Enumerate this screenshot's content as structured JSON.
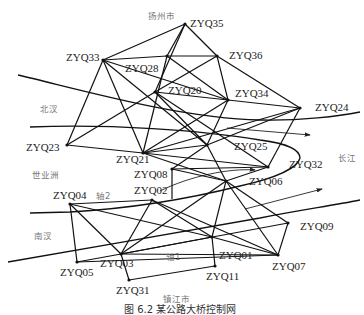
{
  "figure": {
    "caption": "图 6.2   某公路大桥控制网"
  },
  "regions": [
    {
      "id": "yangzhou",
      "label": "扬州市",
      "x": 148,
      "y": 19
    },
    {
      "id": "beihan",
      "label": "北汊",
      "x": 40,
      "y": 112
    },
    {
      "id": "shiyezhou",
      "label": "世业洲",
      "x": 32,
      "y": 178
    },
    {
      "id": "nanhan",
      "label": "南汊",
      "x": 34,
      "y": 239
    },
    {
      "id": "changjiang",
      "label": "长江",
      "x": 338,
      "y": 161
    },
    {
      "id": "zhenjiang",
      "label": "镇江市",
      "x": 163,
      "y": 302
    },
    {
      "id": "axis1",
      "label": "轴1",
      "x": 166,
      "y": 260
    },
    {
      "id": "axis2",
      "label": "轴2",
      "x": 96,
      "y": 199
    }
  ],
  "stations": [
    {
      "id": "ZYQ35",
      "label": "ZYQ35",
      "x": 185,
      "y": 24,
      "lx": 190,
      "ly": 27
    },
    {
      "id": "ZYQ33",
      "label": "ZYQ33",
      "x": 103,
      "y": 60,
      "lx": 66,
      "ly": 61
    },
    {
      "id": "ZYQ28",
      "label": "ZYQ28",
      "x": 167,
      "y": 56,
      "lx": 125,
      "ly": 72
    },
    {
      "id": "ZYQ36",
      "label": "ZYQ36",
      "x": 217,
      "y": 56,
      "lx": 229,
      "ly": 59
    },
    {
      "id": "ZYQ20",
      "label": "ZYQ20",
      "x": 155,
      "y": 92,
      "lx": 168,
      "ly": 94
    },
    {
      "id": "ZYQ34",
      "label": "ZYQ34",
      "x": 228,
      "y": 100,
      "lx": 235,
      "ly": 97
    },
    {
      "id": "ZYQ24",
      "label": "ZYQ24",
      "x": 300,
      "y": 108,
      "lx": 315,
      "ly": 111
    },
    {
      "id": "ZYQ23",
      "label": "ZYQ23",
      "x": 67,
      "y": 145,
      "lx": 26,
      "ly": 151
    },
    {
      "id": "ZYQ21",
      "label": "ZYQ21",
      "x": 143,
      "y": 153,
      "lx": 116,
      "ly": 163
    },
    {
      "id": "ZYQ25",
      "label": "ZYQ25",
      "x": 207,
      "y": 145,
      "lx": 234,
      "ly": 150
    },
    {
      "id": "ZYQ08",
      "label": "ZYQ08",
      "x": 172,
      "y": 169,
      "lx": 134,
      "ly": 178
    },
    {
      "id": "ZYQ32",
      "label": "ZYQ32",
      "x": 268,
      "y": 167,
      "lx": 289,
      "ly": 168
    },
    {
      "id": "ZYQ06",
      "label": "ZYQ06",
      "x": 226,
      "y": 181,
      "lx": 249,
      "ly": 185
    },
    {
      "id": "ZYQ02",
      "label": "ZYQ02",
      "x": 152,
      "y": 200,
      "lx": 134,
      "ly": 194
    },
    {
      "id": "ZYQ04",
      "label": "ZYQ04",
      "x": 70,
      "y": 204,
      "lx": 53,
      "ly": 199
    },
    {
      "id": "ZYQ03",
      "label": "ZYQ03",
      "x": 121,
      "y": 254,
      "lx": 100,
      "ly": 267
    },
    {
      "id": "ZYQ05",
      "label": "ZYQ05",
      "x": 77,
      "y": 262,
      "lx": 60,
      "ly": 276
    },
    {
      "id": "ZYQ31",
      "label": "ZYQ31",
      "x": 129,
      "y": 280,
      "lx": 116,
      "ly": 294
    },
    {
      "id": "ZYQ01",
      "label": "ZYQ01",
      "x": 212,
      "y": 237,
      "lx": 219,
      "ly": 259
    },
    {
      "id": "ZYQ11",
      "label": "ZYQ11",
      "x": 215,
      "y": 266,
      "lx": 206,
      "ly": 280
    },
    {
      "id": "ZYQ07",
      "label": "ZYQ07",
      "x": 278,
      "y": 255,
      "lx": 272,
      "ly": 270
    },
    {
      "id": "ZYQ09",
      "label": "ZYQ09",
      "x": 288,
      "y": 223,
      "lx": 300,
      "ly": 230
    }
  ],
  "edges": [
    [
      "ZYQ35",
      "ZYQ33"
    ],
    [
      "ZYQ35",
      "ZYQ36"
    ],
    [
      "ZYQ35",
      "ZYQ28"
    ],
    [
      "ZYQ35",
      "ZYQ20"
    ],
    [
      "ZYQ33",
      "ZYQ28"
    ],
    [
      "ZYQ33",
      "ZYQ23"
    ],
    [
      "ZYQ33",
      "ZYQ21"
    ],
    [
      "ZYQ33",
      "ZYQ34"
    ],
    [
      "ZYQ33",
      "ZYQ25"
    ],
    [
      "ZYQ28",
      "ZYQ36"
    ],
    [
      "ZYQ28",
      "ZYQ21"
    ],
    [
      "ZYQ28",
      "ZYQ34"
    ],
    [
      "ZYQ36",
      "ZYQ20"
    ],
    [
      "ZYQ36",
      "ZYQ34"
    ],
    [
      "ZYQ36",
      "ZYQ24"
    ],
    [
      "ZYQ20",
      "ZYQ23"
    ],
    [
      "ZYQ20",
      "ZYQ34"
    ],
    [
      "ZYQ20",
      "ZYQ25"
    ],
    [
      "ZYQ20",
      "ZYQ32"
    ],
    [
      "ZYQ34",
      "ZYQ21"
    ],
    [
      "ZYQ34",
      "ZYQ24"
    ],
    [
      "ZYQ34",
      "ZYQ25"
    ],
    [
      "ZYQ24",
      "ZYQ25"
    ],
    [
      "ZYQ24",
      "ZYQ32"
    ],
    [
      "ZYQ24",
      "ZYQ21"
    ],
    [
      "ZYQ23",
      "ZYQ21"
    ],
    [
      "ZYQ21",
      "ZYQ25"
    ],
    [
      "ZYQ21",
      "ZYQ32"
    ],
    [
      "ZYQ21",
      "ZYQ06"
    ],
    [
      "ZYQ25",
      "ZYQ08"
    ],
    [
      "ZYQ25",
      "ZYQ06"
    ],
    [
      "ZYQ08",
      "ZYQ32"
    ],
    [
      "ZYQ08",
      "ZYQ06"
    ],
    [
      "ZYQ32",
      "ZYQ06"
    ],
    [
      "ZYQ06",
      "ZYQ03"
    ],
    [
      "ZYQ06",
      "ZYQ07"
    ],
    [
      "ZYQ06",
      "ZYQ01"
    ],
    [
      "ZYQ06",
      "ZYQ09"
    ],
    [
      "ZYQ02",
      "ZYQ04"
    ],
    [
      "ZYQ02",
      "ZYQ03"
    ],
    [
      "ZYQ02",
      "ZYQ01"
    ],
    [
      "ZYQ02",
      "ZYQ07"
    ],
    [
      "ZYQ04",
      "ZYQ03"
    ],
    [
      "ZYQ04",
      "ZYQ05"
    ],
    [
      "ZYQ04",
      "ZYQ01"
    ],
    [
      "ZYQ03",
      "ZYQ05"
    ],
    [
      "ZYQ03",
      "ZYQ31"
    ],
    [
      "ZYQ03",
      "ZYQ01"
    ],
    [
      "ZYQ03",
      "ZYQ07"
    ],
    [
      "ZYQ05",
      "ZYQ07"
    ],
    [
      "ZYQ31",
      "ZYQ11"
    ],
    [
      "ZYQ01",
      "ZYQ11"
    ],
    [
      "ZYQ01",
      "ZYQ07"
    ],
    [
      "ZYQ09",
      "ZYQ07"
    ],
    [
      "ZYQ09",
      "ZYQ03"
    ]
  ],
  "rivers": [
    {
      "id": "north-bank",
      "d": "M18,75 C90,92 180,118 260,120 C300,121 340,116 360,112"
    },
    {
      "id": "north-channel-south",
      "d": "M30,127 C110,124 200,130 260,140 C290,144 300,150 300,158 C298,168 275,178 240,186 C200,196 140,208 70,212 L30,213"
    },
    {
      "id": "south-channel",
      "d": "M8,262 C90,248 180,232 260,218 C300,210 330,206 360,200"
    }
  ],
  "axes": [
    {
      "id": "axis2-arrow",
      "d": "M160,191 C190,176 230,168 255,170",
      "arrow": true
    },
    {
      "id": "axis1-arrow",
      "d": "M245,209 L322,189",
      "arrow": true
    },
    {
      "id": "flow-arrow",
      "d": "M227,128 L310,135",
      "arrow": true
    },
    {
      "id": "zyq08-tick",
      "d": "M172,169 L172,199",
      "arrow": false
    }
  ]
}
